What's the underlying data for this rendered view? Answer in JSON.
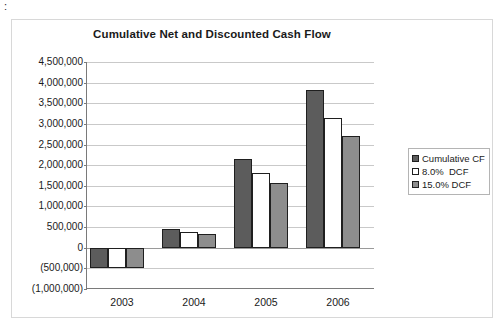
{
  "stray_mark": ":",
  "chart_data": {
    "type": "bar",
    "title": "Cumulative Net and Discounted Cash Flow",
    "xlabel": "",
    "ylabel": "",
    "categories": [
      "2003",
      "2004",
      "2005",
      "2006"
    ],
    "series": [
      {
        "name": "Cumulative CF",
        "color": "#5c5c5c",
        "values": [
          -480000,
          460000,
          2150000,
          3830000
        ]
      },
      {
        "name": "8.0%  DCF",
        "color": "#ffffff",
        "values": [
          -480000,
          390000,
          1820000,
          3150000
        ]
      },
      {
        "name": "15.0% DCF",
        "color": "#8d8d8d",
        "values": [
          -480000,
          330000,
          1570000,
          2700000
        ]
      }
    ],
    "ylim": [
      -1000000,
      4500000
    ],
    "ytick_step": 500000,
    "ytick_labels": [
      "4,500,000",
      "4,000,000",
      "3,500,000",
      "3,000,000",
      "2,500,000",
      "2,000,000",
      "1,500,000",
      "1,000,000",
      "500,000",
      "0",
      "(500,000)",
      "(1,000,000)"
    ],
    "ytick_values": [
      4500000,
      4000000,
      3500000,
      3000000,
      2500000,
      2000000,
      1500000,
      1000000,
      500000,
      0,
      -500000,
      -1000000
    ],
    "grid": true,
    "legend_position": "right",
    "legend_entries": [
      "Cumulative CF",
      "8.0%  DCF",
      "15.0% DCF"
    ]
  }
}
